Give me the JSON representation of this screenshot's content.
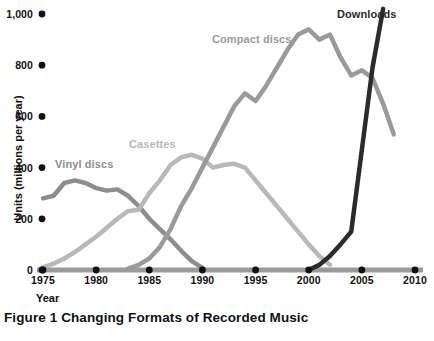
{
  "caption": "Figure 1 Changing Formats of Recorded Music",
  "axes": {
    "x_title": "Year",
    "y_title": "Units (millions per year)"
  },
  "colors": {
    "vinyl": "#8d8d8d",
    "cassettes": "#b8b8b8",
    "compact_discs": "#9a9a9a",
    "downloads": "#2b2b2b",
    "axis": "#9a9a9a",
    "tick_dot": "#111111",
    "text": "#111111"
  },
  "series_labels": {
    "vinyl": "Vinyl discs",
    "cassettes": "Casettes",
    "compact_discs": "Compact discs",
    "downloads": "Downloads"
  },
  "chart_data": {
    "type": "line",
    "title": "Figure 1 Changing Formats of Recorded Music",
    "xlabel": "Year",
    "ylabel": "Units (millions per year)",
    "xlim": [
      1975,
      2010
    ],
    "ylim": [
      0,
      1000
    ],
    "xticks": [
      1975,
      1980,
      1985,
      1990,
      1995,
      2000,
      2005,
      2010
    ],
    "xtick_labels": [
      "1975",
      "1980",
      "1985",
      "1990",
      "1995",
      "2000",
      "2005",
      "2010"
    ],
    "yticks": [
      0,
      200,
      400,
      600,
      800,
      1000
    ],
    "ytick_labels": [
      "0",
      "200",
      "400",
      "600",
      "800",
      "1,000"
    ],
    "grid": false,
    "legend": "inline-labels",
    "series": [
      {
        "name": "Vinyl discs",
        "color": "#8d8d8d",
        "x": [
          1975,
          1976,
          1977,
          1978,
          1979,
          1980,
          1981,
          1982,
          1983,
          1984,
          1985,
          1986,
          1987,
          1988,
          1989,
          1990
        ],
        "values": [
          280,
          290,
          340,
          350,
          340,
          320,
          310,
          315,
          290,
          250,
          200,
          160,
          120,
          75,
          35,
          8
        ]
      },
      {
        "name": "Casettes",
        "color": "#b8b8b8",
        "x": [
          1975,
          1976,
          1977,
          1978,
          1979,
          1980,
          1981,
          1982,
          1983,
          1984,
          1985,
          1986,
          1987,
          1988,
          1989,
          1990,
          1991,
          1992,
          1993,
          1994,
          1995,
          1996,
          1997,
          1998,
          1999,
          2000,
          2001,
          2002
        ],
        "values": [
          10,
          25,
          45,
          70,
          100,
          130,
          165,
          200,
          230,
          235,
          300,
          350,
          410,
          440,
          450,
          435,
          400,
          410,
          415,
          400,
          350,
          300,
          250,
          200,
          150,
          100,
          55,
          20
        ]
      },
      {
        "name": "Compact discs",
        "color": "#9a9a9a",
        "x": [
          1983,
          1984,
          1985,
          1986,
          1987,
          1988,
          1989,
          1990,
          1991,
          1992,
          1993,
          1994,
          1995,
          1996,
          1997,
          1998,
          1999,
          2000,
          2001,
          2002,
          2003,
          2004,
          2005,
          2006,
          2007,
          2008
        ],
        "values": [
          5,
          20,
          45,
          90,
          160,
          250,
          320,
          400,
          480,
          560,
          640,
          690,
          660,
          720,
          790,
          860,
          920,
          940,
          900,
          920,
          830,
          760,
          780,
          750,
          650,
          530
        ]
      },
      {
        "name": "Downloads",
        "color": "#2b2b2b",
        "x": [
          2000,
          2001,
          2002,
          2003,
          2004,
          2005,
          2006,
          2007
        ],
        "values": [
          0,
          20,
          55,
          100,
          150,
          470,
          790,
          1020
        ]
      }
    ]
  }
}
